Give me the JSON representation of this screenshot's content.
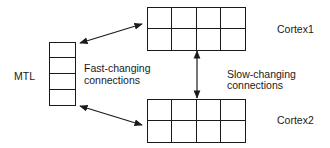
{
  "diagram": {
    "nodes": {
      "mtl": {
        "label": "MTL",
        "rows": 4,
        "cols": 1
      },
      "cortex1": {
        "label": "Cortex1",
        "rows": 2,
        "cols": 4
      },
      "cortex2": {
        "label": "Cortex2",
        "rows": 2,
        "cols": 4
      }
    },
    "edges": {
      "fast": {
        "line1": "Fast-changing",
        "line2": "connections",
        "connects": [
          "MTL",
          "Cortex1",
          "Cortex2"
        ],
        "direction": "bidirectional"
      },
      "slow": {
        "line1": "Slow-changing",
        "line2": "connections",
        "connects": [
          "Cortex1",
          "Cortex2"
        ],
        "direction": "bidirectional"
      }
    },
    "colors": {
      "stroke": "#1a1a1a",
      "background": "#ffffff"
    }
  }
}
